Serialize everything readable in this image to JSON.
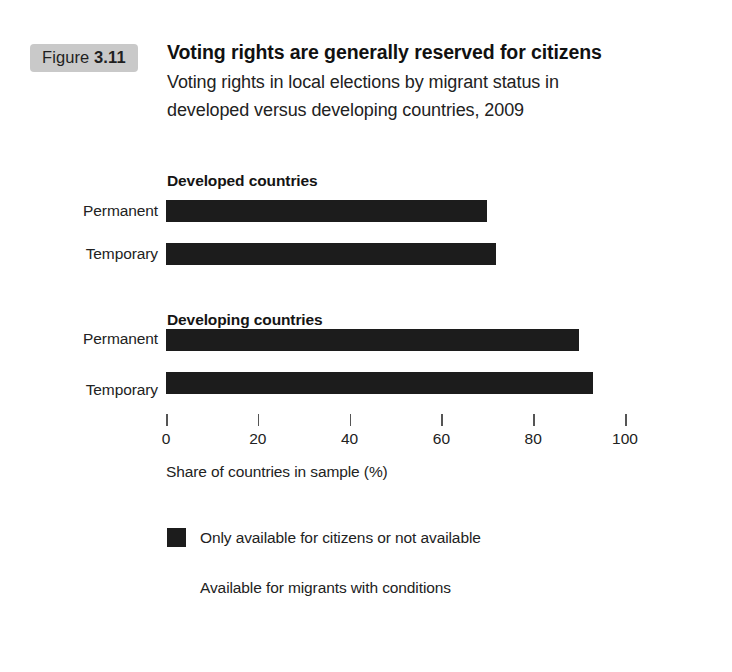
{
  "figure": {
    "prefix": "Figure",
    "number": "3.11"
  },
  "header": {
    "title": "Voting rights are generally reserved for citizens",
    "subtitle_line1": "Voting rights in local elections by migrant status in",
    "subtitle_line2": "developed versus developing countries, 2009"
  },
  "colors": {
    "bar": "#1c1c1c",
    "badge_background": "#c9c9c9",
    "legend_swatch_1": "#1c1c1c",
    "legend_swatch_2": "#ffffff",
    "text": "#222222",
    "background": "#ffffff"
  },
  "chart_data": {
    "type": "bar",
    "orientation": "horizontal",
    "title": "Voting rights are generally reserved for citizens",
    "subtitle": "Voting rights in local elections by migrant status in developed versus developing countries, 2009",
    "xlabel": "Share of countries in sample (%)",
    "ylabel": "",
    "xlim": [
      0,
      100
    ],
    "xticks": [
      0,
      20,
      40,
      60,
      80,
      100
    ],
    "xtick_labels": [
      "0",
      "20",
      "40",
      "60",
      "80",
      "100"
    ],
    "grid": false,
    "legend_position": "bottom",
    "groups": [
      {
        "name": "Developed countries",
        "bars": [
          {
            "label": "Permanent",
            "value": 70
          },
          {
            "label": "Temporary",
            "value": 72
          }
        ]
      },
      {
        "name": "Developing countries",
        "bars": [
          {
            "label": "Permanent",
            "value": 90
          },
          {
            "label": "Temporary",
            "value": 93
          }
        ]
      }
    ],
    "series": [
      {
        "name": "Only available for citizens or not available",
        "categories": [
          "Developed countries - Permanent",
          "Developed countries - Temporary",
          "Developing countries - Permanent",
          "Developing countries - Temporary"
        ],
        "values": [
          70,
          72,
          90,
          93
        ]
      },
      {
        "name": "Available for migrants with conditions",
        "categories": [
          "Developed countries - Permanent",
          "Developed countries - Temporary",
          "Developing countries - Permanent",
          "Developing countries - Temporary"
        ],
        "values": [
          30,
          28,
          10,
          7
        ]
      }
    ],
    "legend": [
      {
        "label": "Only available for citizens or not available",
        "color": "#1c1c1c"
      },
      {
        "label": "Available for migrants with conditions",
        "color": "#ffffff"
      }
    ]
  }
}
